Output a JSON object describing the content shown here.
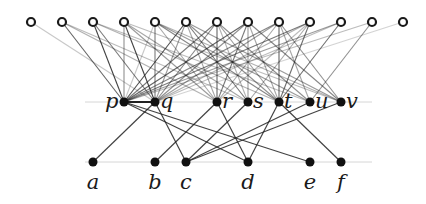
{
  "diagram": {
    "type": "tripartite-graph",
    "guides": [
      {
        "y": 102,
        "x1": 85,
        "x2": 372
      },
      {
        "y": 162,
        "x1": 85,
        "x2": 372
      }
    ],
    "top_row": {
      "y": 22,
      "style": "hollow",
      "nodes": [
        {
          "id": "T1",
          "x": 31
        },
        {
          "id": "T2",
          "x": 62
        },
        {
          "id": "T3",
          "x": 93
        },
        {
          "id": "T4",
          "x": 124
        },
        {
          "id": "T5",
          "x": 155
        },
        {
          "id": "T6",
          "x": 186
        },
        {
          "id": "T7",
          "x": 217
        },
        {
          "id": "T8",
          "x": 248
        },
        {
          "id": "T9",
          "x": 279
        },
        {
          "id": "T10",
          "x": 310
        },
        {
          "id": "T11",
          "x": 341
        },
        {
          "id": "T12",
          "x": 372
        },
        {
          "id": "T13",
          "x": 403
        }
      ]
    },
    "middle_row": {
      "y": 102,
      "style": "filled",
      "nodes": [
        {
          "id": "p",
          "label": "p",
          "x": 124,
          "label_side": "left"
        },
        {
          "id": "q",
          "label": "q",
          "x": 155,
          "label_side": "right"
        },
        {
          "id": "r",
          "label": "r",
          "x": 217,
          "label_side": "right"
        },
        {
          "id": "s",
          "label": "s",
          "x": 248,
          "label_side": "right"
        },
        {
          "id": "t",
          "label": "t",
          "x": 279,
          "label_side": "right"
        },
        {
          "id": "u",
          "label": "u",
          "x": 310,
          "label_side": "right"
        },
        {
          "id": "v",
          "label": "v",
          "x": 341,
          "label_side": "right"
        }
      ]
    },
    "bottom_row": {
      "y": 162,
      "style": "filled",
      "nodes": [
        {
          "id": "a",
          "label": "a",
          "x": 93
        },
        {
          "id": "b",
          "label": "b",
          "x": 155
        },
        {
          "id": "c",
          "label": "c",
          "x": 186
        },
        {
          "id": "d",
          "label": "d",
          "x": 248
        },
        {
          "id": "e",
          "label": "e",
          "x": 310
        },
        {
          "id": "f",
          "label": "f",
          "x": 341
        }
      ]
    },
    "top_edges": [
      [
        "T1",
        "q",
        0.25
      ],
      [
        "T2",
        "p",
        0.7
      ],
      [
        "T2",
        "r",
        0.35
      ],
      [
        "T2",
        "s",
        0.3
      ],
      [
        "T3",
        "p",
        0.85
      ],
      [
        "T3",
        "q",
        0.6
      ],
      [
        "T3",
        "t",
        0.35
      ],
      [
        "T3",
        "u",
        0.3
      ],
      [
        "T4",
        "p",
        0.5
      ],
      [
        "T4",
        "q",
        0.85
      ],
      [
        "T4",
        "r",
        0.45
      ],
      [
        "T4",
        "s",
        0.4
      ],
      [
        "T4",
        "v",
        0.3
      ],
      [
        "T5",
        "p",
        0.25
      ],
      [
        "T5",
        "q",
        0.6
      ],
      [
        "T5",
        "t",
        0.55
      ],
      [
        "T5",
        "u",
        0.45
      ],
      [
        "T5",
        "v",
        0.35
      ],
      [
        "T5",
        "r",
        0.4
      ],
      [
        "T6",
        "p",
        0.8
      ],
      [
        "T6",
        "q",
        0.45
      ],
      [
        "T6",
        "s",
        0.6
      ],
      [
        "T6",
        "t",
        0.5
      ],
      [
        "T6",
        "v",
        0.45
      ],
      [
        "T6",
        "r",
        0.4
      ],
      [
        "T7",
        "p",
        0.6
      ],
      [
        "T7",
        "q",
        0.55
      ],
      [
        "T7",
        "r",
        0.7
      ],
      [
        "T7",
        "t",
        0.45
      ],
      [
        "T7",
        "u",
        0.5
      ],
      [
        "T7",
        "s",
        0.35
      ],
      [
        "T8",
        "p",
        0.7
      ],
      [
        "T8",
        "q",
        0.5
      ],
      [
        "T8",
        "r",
        0.6
      ],
      [
        "T8",
        "s",
        0.45
      ],
      [
        "T8",
        "v",
        0.55
      ],
      [
        "T8",
        "t",
        0.4
      ],
      [
        "T9",
        "p",
        0.55
      ],
      [
        "T9",
        "q",
        0.45
      ],
      [
        "T9",
        "r",
        0.4
      ],
      [
        "T9",
        "t",
        0.7
      ],
      [
        "T9",
        "u",
        0.4
      ],
      [
        "T9",
        "v",
        0.5
      ],
      [
        "T10",
        "p",
        0.6
      ],
      [
        "T10",
        "q",
        0.35
      ],
      [
        "T10",
        "t",
        0.65
      ],
      [
        "T10",
        "s",
        0.4
      ],
      [
        "T10",
        "r",
        0.3
      ],
      [
        "T11",
        "p",
        0.45
      ],
      [
        "T11",
        "t",
        0.65
      ],
      [
        "T11",
        "q",
        0.3
      ],
      [
        "T12",
        "p",
        0.3
      ],
      [
        "T12",
        "u",
        0.5
      ],
      [
        "T13",
        "q",
        0.2
      ]
    ],
    "lower_edges": [
      [
        "p",
        "q",
        1.0
      ],
      [
        "q",
        "a",
        0.85
      ],
      [
        "p",
        "d",
        0.85
      ],
      [
        "p",
        "e",
        0.85
      ],
      [
        "q",
        "c",
        0.85
      ],
      [
        "r",
        "b",
        0.85
      ],
      [
        "r",
        "d",
        0.85
      ],
      [
        "s",
        "c",
        0.85
      ],
      [
        "t",
        "d",
        0.85
      ],
      [
        "t",
        "f",
        0.85
      ],
      [
        "u",
        "c",
        0.85
      ],
      [
        "v",
        "c",
        0.85
      ]
    ]
  }
}
